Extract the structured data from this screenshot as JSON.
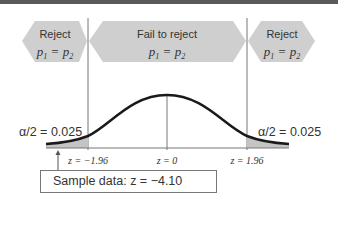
{
  "regions": {
    "left": {
      "title": "Reject",
      "formula": "p1 = p2",
      "sub1": "1",
      "sub2": "2"
    },
    "middle": {
      "title": "Fail to reject",
      "formula": "p1 = p2",
      "sub1": "1",
      "sub2": "2"
    },
    "right": {
      "title": "Reject",
      "formula": "p1 = p2",
      "sub1": "1",
      "sub2": "2"
    }
  },
  "tails": {
    "left_label": "α/2 = 0.025",
    "right_label": "α/2 = 0.025"
  },
  "axis": {
    "left_tick": "z = −1.96",
    "center_tick": "z = 0",
    "right_tick": "z = 1.96"
  },
  "sample": {
    "label": "Sample data: z = −4.10"
  },
  "colors": {
    "arrow_fill": "#cfcfcf",
    "curve": "#1a1a1a",
    "tail_fill": "#c4c4c4",
    "lines": "#777777"
  }
}
